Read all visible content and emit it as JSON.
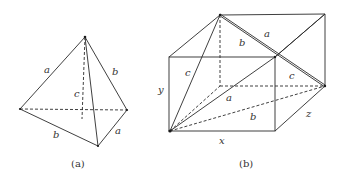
{
  "figure_a": {
    "caption": "(a)",
    "labels": {
      "left_edge": "a",
      "right_edge": "b",
      "height": "c",
      "bottom_left": "b",
      "bottom_right": "a"
    }
  },
  "figure_b": {
    "caption": "(b)",
    "labels": {
      "top_a": "a",
      "top_b": "b",
      "right_c": "c",
      "left_c": "c",
      "diag_a": "a",
      "diag_b": "b",
      "x": "x",
      "y": "y",
      "z": "z"
    }
  },
  "colors": {
    "line": "#2a2a2a",
    "text": "#333333",
    "background": "#ffffff"
  }
}
